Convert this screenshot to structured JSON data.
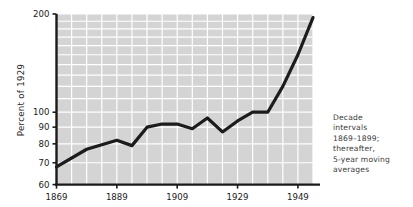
{
  "chart_data": {
    "type": "line",
    "title": "",
    "xlabel": "",
    "ylabel": "Percent of 1929",
    "yscale": "log",
    "ylim": [
      60,
      200
    ],
    "xlim": [
      1869,
      1954
    ],
    "grid": true,
    "legend": false,
    "ytick_labels": [
      "60",
      "70",
      "80",
      "90",
      "100",
      "200"
    ],
    "ytick_values": [
      60,
      70,
      80,
      90,
      100,
      200
    ],
    "xtick_labels": [
      "1869",
      "1889",
      "1909",
      "1929",
      "1949"
    ],
    "xtick_values": [
      1869,
      1889,
      1909,
      1929,
      1949
    ],
    "series": [
      {
        "name": "Index",
        "x": [
          1869,
          1879,
          1889,
          1894,
          1899,
          1904,
          1909,
          1914,
          1919,
          1924,
          1929,
          1934,
          1939,
          1944,
          1949,
          1954
        ],
        "values": [
          68,
          77,
          82,
          79,
          90,
          92,
          92,
          89,
          96,
          87,
          94,
          100,
          100,
          120,
          150,
          195
        ]
      }
    ],
    "annotations": [
      "Decade intervals 1869–1899; thereafter, 5-year moving averages"
    ],
    "colors": {
      "plot_background": "#d4d4d4",
      "gridline": "#ffffff",
      "line": "#1c1c1c",
      "axis": "#1a1a1a",
      "text": "#3a3a3a"
    }
  },
  "caption": {
    "line1": "Decade",
    "line2": "intervals",
    "line3": "1869–1899;",
    "line4": "thereafter,",
    "line5": "5-year moving",
    "line6": "averages"
  },
  "axis": {
    "y_title": "Percent of 1929",
    "y_ticks": [
      "200",
      "100",
      "90",
      "80",
      "70",
      "60"
    ],
    "x_ticks": [
      "1869",
      "1889",
      "1909",
      "1929",
      "1949"
    ]
  }
}
